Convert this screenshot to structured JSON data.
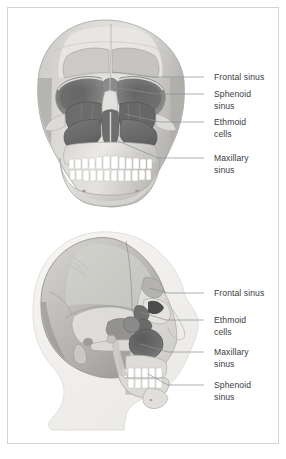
{
  "figure": {
    "background_color": "#ffffff",
    "frame_color": "#d2d2d4",
    "label_color": "#3b3b3f",
    "leader_color": "#8c8c92"
  },
  "palette": {
    "soft_tissue": "#f4f3f1",
    "bone_light": "#e8e7e4",
    "bone_mid": "#cfcec9",
    "cranium": "#b9b8b4",
    "cranium_shade": "#a2a19d",
    "sinus_frontal": "#c8c7c3",
    "sinus_dark": "#6e6e6e",
    "sinus_mid": "#8d8d8d",
    "orbit": "#7c7c7c",
    "orbit_deep": "#4f4f4f",
    "tooth": "#ffffff",
    "outline": "#9a9a98"
  },
  "panels": [
    {
      "id": "anterior",
      "view_name": "anterior-skull-view",
      "labels": [
        {
          "id": "frontal",
          "lines": [
            "Frontal sinus"
          ],
          "text_x": 206,
          "text_y": 72,
          "leader": "M 196 69 L 144 69 L 104 64"
        },
        {
          "id": "sphenoid",
          "lines": [
            "Sphenoid",
            "sinus"
          ],
          "text_x": 206,
          "text_y": 89,
          "leader": "M 196 86 L 150 86 L 88 77"
        },
        {
          "id": "ethmoid",
          "lines": [
            "Ethmoid",
            "cells"
          ],
          "text_x": 206,
          "text_y": 117,
          "leader": "M 196 114 L 152 114 L 117 106"
        },
        {
          "id": "maxillary",
          "lines": [
            "Maxillary",
            "sinus"
          ],
          "text_x": 206,
          "text_y": 153,
          "leader": "M 196 150 L 150 150 L 110 133"
        }
      ]
    },
    {
      "id": "lateral",
      "view_name": "lateral-skull-view",
      "labels": [
        {
          "id": "frontal",
          "lines": [
            "Frontal sinus"
          ],
          "text_x": 206,
          "text_y": 74,
          "leader": "M 196 71 L 160 71 L 141 66"
        },
        {
          "id": "ethmoid",
          "lines": [
            "Ethmoid",
            "cells"
          ],
          "text_x": 206,
          "text_y": 101,
          "leader": "M 196 98 L 158 98 L 132 90"
        },
        {
          "id": "maxillary",
          "lines": [
            "Maxillary",
            "sinus"
          ],
          "text_x": 206,
          "text_y": 133,
          "leader": "M 196 130 L 160 130 L 132 122"
        },
        {
          "id": "sphenoid",
          "lines": [
            "Sphenoid",
            "sinus"
          ],
          "text_x": 206,
          "text_y": 166,
          "leader": "M 196 163 L 160 163 L 140 152"
        }
      ]
    }
  ]
}
